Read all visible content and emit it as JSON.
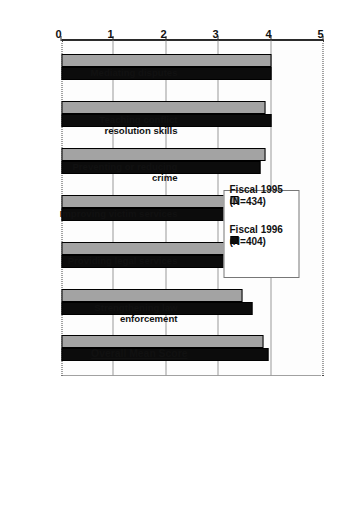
{
  "chart_data": {
    "type": "bar",
    "title": "",
    "subtitle": "",
    "xlabel": "",
    "ylabel": "",
    "ylim": [
      0,
      5
    ],
    "yticks": [
      0,
      1,
      2,
      3,
      4,
      5
    ],
    "ytick_labels": [
      "0",
      "1",
      "2",
      "3",
      "4",
      "5"
    ],
    "grid": true,
    "orientation": "vertical-bars-rotated-90",
    "legend_position": "top-right-inside",
    "categories": [
      "Mediating disputes",
      "Teaching conflict resolution skills",
      "Preventing or reducing crime",
      "Improving victim services",
      "Providing legal services",
      "Strengthening law enforcement",
      "Overall Mean Score"
    ],
    "series": [
      {
        "name": "Fiscal 1995 (N=434)",
        "color": "#a3a3a3",
        "values": [
          4.0,
          3.9,
          3.9,
          3.9,
          3.5,
          3.45,
          3.85
        ]
      },
      {
        "name": "Fiscal 1996 (N=404)",
        "color": "#0c0c0c",
        "values": [
          4.0,
          4.0,
          3.8,
          3.8,
          3.9,
          3.65,
          3.95
        ]
      }
    ],
    "annotations": []
  },
  "legend": {
    "items": [
      {
        "label": "Fiscal 1995\n(N=434)",
        "swatch": "legend-swatch-gray",
        "color": "#a3a3a3"
      },
      {
        "label": "Fiscal 1996\n(N=404)",
        "swatch": "legend-swatch-black",
        "color": "#0c0c0c"
      }
    ]
  },
  "axis": {
    "ticks": [
      "0",
      "1",
      "2",
      "3",
      "4",
      "5"
    ]
  },
  "categories_meta": [
    {
      "label": "Mediating disputes",
      "emphasis": false
    },
    {
      "label": "Teaching conflict resolution skills",
      "emphasis": false
    },
    {
      "label": "Preventing or reducing crime",
      "emphasis": false
    },
    {
      "label": "Improving victim services",
      "emphasis": false
    },
    {
      "label": "Providing legal services",
      "emphasis": false
    },
    {
      "label": "Strengthening law enforcement",
      "emphasis": false
    },
    {
      "label": "Overall Mean Score",
      "emphasis": true
    }
  ]
}
